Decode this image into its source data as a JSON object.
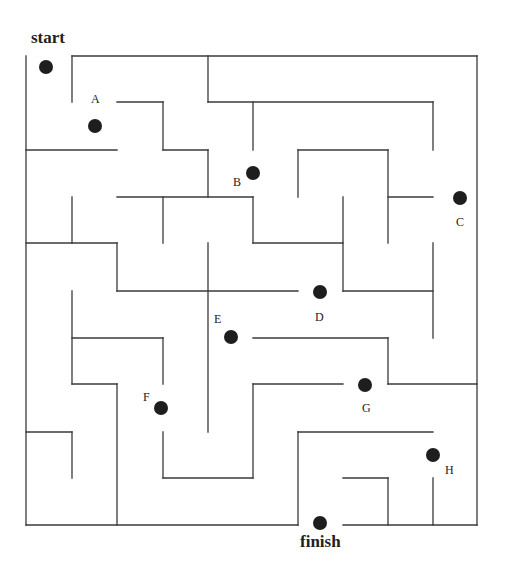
{
  "colors": {
    "wall": "#3a3a3a",
    "dot": "#1e1e1e",
    "background": "#ffffff"
  },
  "labels": {
    "start": "start",
    "finish": "finish"
  },
  "points": [
    {
      "id": "start",
      "label": "",
      "x": 46,
      "y": 67,
      "lx": 0,
      "ly": 0
    },
    {
      "id": "A",
      "label": "A",
      "x": 95,
      "y": 126,
      "lx": 91,
      "ly": 92
    },
    {
      "id": "B",
      "label": "B",
      "x": 253,
      "y": 173,
      "lx": 233,
      "ly": 175
    },
    {
      "id": "C",
      "label": "C",
      "x": 460,
      "y": 198,
      "lx": 456,
      "ly": 215
    },
    {
      "id": "D",
      "label": "D",
      "x": 320,
      "y": 292,
      "lx": 315,
      "ly": 310
    },
    {
      "id": "E",
      "label": "E",
      "x": 231,
      "y": 337,
      "lx": 214,
      "ly": 312
    },
    {
      "id": "F",
      "label": "F",
      "x": 161,
      "y": 408,
      "lx": 143,
      "ly": 390
    },
    {
      "id": "G",
      "label": "G",
      "x": 365,
      "y": 385,
      "lx": 362,
      "ly": 401
    },
    {
      "id": "H",
      "label": "H",
      "x": 433,
      "y": 455,
      "lx": 445,
      "ly": 463
    },
    {
      "id": "finish",
      "label": "",
      "x": 320,
      "y": 523,
      "lx": 0,
      "ly": 0
    }
  ],
  "walls": [
    [
      26,
      56,
      26,
      525
    ],
    [
      72,
      56,
      477,
      56
    ],
    [
      477,
      56,
      477,
      525
    ],
    [
      26,
      525,
      298,
      525
    ],
    [
      343,
      525,
      477,
      525
    ],
    [
      72,
      56,
      72,
      102
    ],
    [
      117,
      102,
      163,
      102
    ],
    [
      163,
      102,
      163,
      150
    ],
    [
      163,
      150,
      208,
      150
    ],
    [
      208,
      150,
      208,
      197
    ],
    [
      26,
      150,
      117,
      150
    ],
    [
      208,
      56,
      208,
      102
    ],
    [
      208,
      102,
      433,
      102
    ],
    [
      433,
      102,
      433,
      150
    ],
    [
      253,
      102,
      253,
      150
    ],
    [
      298,
      150,
      388,
      150
    ],
    [
      298,
      150,
      298,
      197
    ],
    [
      388,
      150,
      388,
      243
    ],
    [
      388,
      197,
      433,
      197
    ],
    [
      117,
      197,
      253,
      197
    ],
    [
      253,
      197,
      253,
      243
    ],
    [
      163,
      197,
      163,
      243
    ],
    [
      72,
      197,
      72,
      243
    ],
    [
      26,
      243,
      117,
      243
    ],
    [
      117,
      243,
      117,
      291
    ],
    [
      117,
      291,
      298,
      291
    ],
    [
      253,
      243,
      343,
      243
    ],
    [
      343,
      197,
      343,
      291
    ],
    [
      343,
      291,
      433,
      291
    ],
    [
      433,
      243,
      433,
      338
    ],
    [
      208,
      243,
      208,
      432
    ],
    [
      72,
      291,
      72,
      384
    ],
    [
      72,
      338,
      163,
      338
    ],
    [
      163,
      338,
      163,
      384
    ],
    [
      253,
      338,
      388,
      338
    ],
    [
      388,
      338,
      388,
      384
    ],
    [
      388,
      384,
      477,
      384
    ],
    [
      117,
      384,
      117,
      525
    ],
    [
      72,
      384,
      117,
      384
    ],
    [
      26,
      432,
      72,
      432
    ],
    [
      72,
      432,
      72,
      478
    ],
    [
      163,
      432,
      163,
      478
    ],
    [
      163,
      478,
      253,
      478
    ],
    [
      253,
      384,
      253,
      478
    ],
    [
      253,
      384,
      343,
      384
    ],
    [
      298,
      432,
      298,
      525
    ],
    [
      298,
      432,
      433,
      432
    ],
    [
      343,
      478,
      388,
      478
    ],
    [
      388,
      478,
      388,
      525
    ],
    [
      433,
      478,
      433,
      525
    ]
  ]
}
